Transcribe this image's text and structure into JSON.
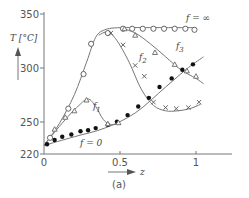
{
  "chart_data": {
    "type": "line",
    "title": "",
    "subtitle": "",
    "panel_label": "(a)",
    "xlabel": "z",
    "ylabel": "T [°C]",
    "xlim": [
      0,
      1.1
    ],
    "ylim": [
      220,
      350
    ],
    "x_ticks": [
      {
        "value": 0,
        "label": "0",
        "px": 44
      },
      {
        "value": 0.5,
        "label": "0.5",
        "px": 120
      },
      {
        "value": 1,
        "label": "1",
        "px": 196
      }
    ],
    "y_ticks": [
      {
        "value": 220,
        "label": "220",
        "py": 154
      },
      {
        "value": 250,
        "label": "250",
        "py": 122
      },
      {
        "value": 300,
        "label": "300",
        "py": 68
      },
      {
        "value": 350,
        "label": "350",
        "py": 14
      }
    ],
    "grid": false,
    "legend": "inline curve labels",
    "series": [
      {
        "name": "f = ∞",
        "label": "f = ∞",
        "marker": "open-circle",
        "curve": [
          [
            0,
            228
          ],
          [
            0.1,
            248
          ],
          [
            0.2,
            275
          ],
          [
            0.28,
            305
          ],
          [
            0.34,
            328
          ],
          [
            0.4,
            335
          ],
          [
            0.5,
            337
          ],
          [
            0.7,
            337
          ],
          [
            1,
            337
          ]
        ],
        "points": [
          [
            0.04,
            235
          ],
          [
            0.16,
            262
          ],
          [
            0.26,
            294
          ],
          [
            0.31,
            322
          ],
          [
            0.42,
            332
          ],
          [
            0.52,
            336
          ],
          [
            0.58,
            336
          ],
          [
            0.65,
            336
          ],
          [
            0.72,
            336
          ],
          [
            0.79,
            336
          ],
          [
            0.86,
            336
          ],
          [
            0.93,
            336
          ],
          [
            0.99,
            335
          ]
        ]
      },
      {
        "name": "f = 0",
        "label": "f = 0",
        "marker": "filled-circle",
        "curve": [
          [
            0,
            228
          ],
          [
            0.2,
            236
          ],
          [
            0.4,
            244
          ],
          [
            0.6,
            258
          ],
          [
            0.8,
            282
          ],
          [
            0.95,
            300
          ],
          [
            1.05,
            310
          ]
        ],
        "points": [
          [
            0.02,
            229
          ],
          [
            0.07,
            233
          ],
          [
            0.12,
            236
          ],
          [
            0.18,
            238
          ],
          [
            0.24,
            241
          ],
          [
            0.29,
            242
          ],
          [
            0.34,
            244
          ],
          [
            0.42,
            247
          ],
          [
            0.48,
            250
          ],
          [
            0.55,
            256
          ],
          [
            0.62,
            264
          ],
          [
            0.69,
            272
          ],
          [
            0.76,
            282
          ],
          [
            0.84,
            290
          ],
          [
            0.91,
            298
          ],
          [
            0.98,
            303
          ]
        ]
      },
      {
        "name": "f1",
        "label": "f1",
        "marker": "open-triangle",
        "curve": [
          [
            0,
            228
          ],
          [
            0.08,
            242
          ],
          [
            0.16,
            255
          ],
          [
            0.23,
            265
          ],
          [
            0.29,
            271
          ],
          [
            0.34,
            264
          ],
          [
            0.39,
            252
          ],
          [
            0.44,
            247
          ],
          [
            0.5,
            249
          ]
        ],
        "points": [
          [
            0.07,
            243
          ],
          [
            0.14,
            254
          ],
          [
            0.2,
            260
          ],
          [
            0.28,
            270
          ],
          [
            0.42,
            248
          ],
          [
            0.49,
            249
          ]
        ]
      },
      {
        "name": "f2",
        "label": "f2",
        "marker": "cross",
        "curve": [
          [
            0.36,
            330
          ],
          [
            0.42,
            333
          ],
          [
            0.48,
            325
          ],
          [
            0.56,
            305
          ],
          [
            0.64,
            280
          ],
          [
            0.72,
            265
          ],
          [
            0.8,
            260
          ],
          [
            0.88,
            260
          ],
          [
            0.96,
            262
          ],
          [
            1.03,
            266
          ]
        ],
        "points": [
          [
            0.44,
            332
          ],
          [
            0.52,
            321
          ],
          [
            0.6,
            302
          ],
          [
            0.66,
            292
          ],
          [
            0.72,
            268
          ],
          [
            0.8,
            263
          ],
          [
            0.87,
            262
          ],
          [
            0.95,
            263
          ],
          [
            1.02,
            268
          ]
        ]
      },
      {
        "name": "f3",
        "label": "f3",
        "marker": "open-triangle",
        "curve": [
          [
            0.5,
            337
          ],
          [
            0.6,
            332
          ],
          [
            0.7,
            322
          ],
          [
            0.8,
            310
          ],
          [
            0.9,
            298
          ],
          [
            1.0,
            290
          ],
          [
            1.05,
            285
          ]
        ],
        "points": [
          [
            0.53,
            336
          ],
          [
            0.6,
            330
          ],
          [
            0.73,
            314
          ],
          [
            0.86,
            303
          ],
          [
            0.94,
            297
          ],
          [
            1.0,
            292
          ]
        ]
      }
    ],
    "annotations": [
      {
        "text": "f = ∞",
        "x": 0.95,
        "y": 343
      },
      {
        "text": "f3",
        "x": 0.8,
        "y": 313
      },
      {
        "text": "f2",
        "x": 0.66,
        "y": 298
      },
      {
        "text": "f1",
        "x": 0.31,
        "y": 265
      },
      {
        "text": "f = 0",
        "x": 0.31,
        "y": 237
      }
    ]
  },
  "labels": {
    "y_axis_title": "T [°C]",
    "x_axis_title": "z",
    "panel": "(a)",
    "f_inf": "f = ∞",
    "f_zero": "f = 0",
    "f1": "f",
    "f1_sub": "1",
    "f2": "f",
    "f2_sub": "2",
    "f3": "f",
    "f3_sub": "3",
    "tick_0": "0",
    "tick_05": "0.5",
    "tick_1": "1",
    "tick_220": "220",
    "tick_250": "250",
    "tick_300": "300",
    "tick_350": "350"
  }
}
